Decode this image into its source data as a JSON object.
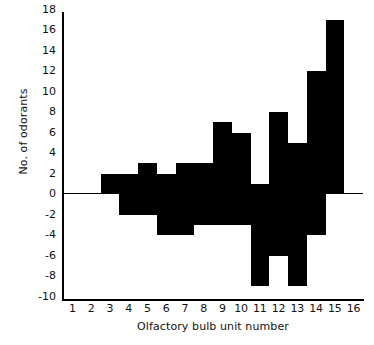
{
  "chart_data": {
    "type": "bar",
    "title": "",
    "xlabel": "Olfactory bulb unit number",
    "ylabel": "No. of odorants",
    "categories": [
      1,
      2,
      3,
      4,
      5,
      6,
      7,
      8,
      9,
      10,
      11,
      12,
      13,
      14,
      15,
      16
    ],
    "x_tick_labels": [
      "1",
      "2",
      "3",
      "4",
      "5",
      "6",
      "7",
      "8",
      "9",
      "10",
      "11",
      "12",
      "13",
      "14",
      "15",
      "16"
    ],
    "y_tick_labels": [
      "18",
      "16",
      "14",
      "12",
      "10",
      "8",
      "6",
      "4",
      "2",
      "0",
      "-2",
      "-4",
      "-6",
      "-8",
      "-10"
    ],
    "y_tick_values": [
      18,
      16,
      14,
      12,
      10,
      8,
      6,
      4,
      2,
      0,
      -2,
      -4,
      -6,
      -8,
      -10
    ],
    "ylim": [
      -10,
      18
    ],
    "xlim": [
      1,
      16
    ],
    "grid": false,
    "legend": null,
    "bar_color": "#000000",
    "axis_color": "#000000",
    "background": "#ffffff",
    "note": "Back-to-back bars: each unit has a positive excitatory count and a negative inhibitory count.",
    "positive_values": [
      0,
      0,
      2,
      0,
      3,
      0,
      3,
      0,
      7,
      0,
      1,
      8,
      5,
      12,
      17,
      0
    ],
    "negative_values": [
      0,
      0,
      0,
      -2,
      0,
      -4,
      0,
      -3,
      0,
      -3,
      -9,
      -9,
      -9,
      -4,
      0,
      0
    ],
    "bars": [
      {
        "unit": 1,
        "positive": 0,
        "negative": 0
      },
      {
        "unit": 2,
        "positive": 0,
        "negative": 0
      },
      {
        "unit": 3,
        "positive": 2,
        "negative": 0
      },
      {
        "unit": 4,
        "positive": 2,
        "negative": -2
      },
      {
        "unit": 5,
        "positive": 3,
        "negative": -2
      },
      {
        "unit": 6,
        "positive": 2,
        "negative": -4
      },
      {
        "unit": 7,
        "positive": 3,
        "negative": -4
      },
      {
        "unit": 8,
        "positive": 3,
        "negative": -3
      },
      {
        "unit": 9,
        "positive": 7,
        "negative": -3
      },
      {
        "unit": 10,
        "positive": 6,
        "negative": -3
      },
      {
        "unit": 11,
        "positive": 1,
        "negative": -9
      },
      {
        "unit": 12,
        "positive": 8,
        "negative": -6
      },
      {
        "unit": 13,
        "positive": 5,
        "negative": -9
      },
      {
        "unit": 14,
        "positive": 12,
        "negative": -4
      },
      {
        "unit": 15,
        "positive": 17,
        "negative": 0
      },
      {
        "unit": 16,
        "positive": 0,
        "negative": 0
      }
    ]
  },
  "geometry": {
    "plot_left": 63,
    "plot_right": 363,
    "plot_top": 13,
    "plot_bottom": 300,
    "zero_y": 194,
    "px_per_unit": 10.25
  }
}
